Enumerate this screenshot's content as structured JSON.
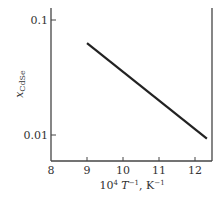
{
  "chart_data": {
    "type": "line",
    "title": "",
    "xlabel": "10⁴ T⁻¹, K⁻¹",
    "xlabel_parts": {
      "base": "10",
      "exp": "4",
      "var": " T",
      "var_exp": "−1",
      "unit": ", K",
      "unit_exp": "−1"
    },
    "ylabel": "x_CdSe",
    "ylabel_parts": {
      "main": "x",
      "sub": "CdSe"
    },
    "xlim": [
      8,
      12.45
    ],
    "ylim": [
      0.0065,
      0.13
    ],
    "yscale": "log",
    "grid": false,
    "legend": "none",
    "x_ticks": [
      8,
      9,
      10,
      11,
      12
    ],
    "x_tick_labels": [
      "8",
      "9",
      "10",
      "11",
      "12"
    ],
    "y_ticks": [
      0.1,
      0.01
    ],
    "y_tick_labels": [
      "0.1",
      "0.01"
    ],
    "series": [
      {
        "name": "x_CdSe",
        "color": "#222222",
        "x": [
          9.0,
          12.33
        ],
        "y": [
          0.063,
          0.0093
        ]
      }
    ]
  }
}
